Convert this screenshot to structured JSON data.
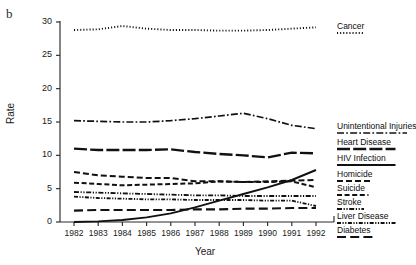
{
  "panel": {
    "label": "b"
  },
  "chart_data": {
    "type": "line",
    "title": "",
    "xlabel": "Year",
    "ylabel": "Rate",
    "xlim": [
      1981.4,
      1992.6
    ],
    "ylim": [
      0,
      30
    ],
    "grid": false,
    "legend_position": "right",
    "x": [
      1982,
      1983,
      1984,
      1985,
      1986,
      1987,
      1988,
      1989,
      1990,
      1991,
      1992
    ],
    "xticks": [
      "1982",
      "1983",
      "1984",
      "1985",
      "1986",
      "1987",
      "1988",
      "1989",
      "1990",
      "1991",
      "1992"
    ],
    "yticks": [
      "0",
      "5",
      "10",
      "15",
      "20",
      "25",
      "30"
    ],
    "series": [
      {
        "name": "Cancer",
        "style": "dotted",
        "values": [
          28.8,
          28.9,
          29.4,
          29.0,
          28.8,
          28.8,
          28.7,
          28.7,
          28.8,
          29.0,
          29.2
        ]
      },
      {
        "name": "Unintentional Injuries",
        "style": "dash-dot",
        "values": [
          15.2,
          15.1,
          15.0,
          15.0,
          15.2,
          15.5,
          15.9,
          16.3,
          15.5,
          14.5,
          14.0
        ]
      },
      {
        "name": "Heart Disease",
        "style": "long-dash",
        "values": [
          11.0,
          10.8,
          10.8,
          10.8,
          10.9,
          10.5,
          10.2,
          10.0,
          9.7,
          10.4,
          10.3
        ]
      },
      {
        "name": "HIV Infection",
        "style": "solid",
        "values": [
          0.0,
          0.1,
          0.3,
          0.7,
          1.3,
          2.2,
          3.2,
          4.2,
          5.2,
          6.3,
          7.8
        ]
      },
      {
        "name": "Homicide",
        "style": "dash",
        "values": [
          7.5,
          7.0,
          6.8,
          6.6,
          6.6,
          6.1,
          6.1,
          6.0,
          6.1,
          6.2,
          6.3
        ]
      },
      {
        "name": "Suicide",
        "style": "medium-dash",
        "values": [
          5.9,
          5.7,
          5.5,
          5.6,
          5.7,
          5.8,
          6.1,
          6.0,
          6.0,
          6.1,
          5.2
        ]
      },
      {
        "name": "Stroke",
        "style": "dash-dot-dot",
        "values": [
          4.5,
          4.4,
          4.3,
          4.2,
          4.1,
          4.0,
          4.0,
          3.9,
          3.9,
          3.9,
          3.9
        ]
      },
      {
        "name": "Liver Disease",
        "style": "dot-dash",
        "values": [
          3.8,
          3.6,
          3.5,
          3.4,
          3.4,
          3.3,
          3.3,
          3.3,
          3.2,
          3.2,
          2.4
        ]
      },
      {
        "name": "Diabetes",
        "style": "wide-dash",
        "values": [
          1.7,
          1.8,
          1.8,
          1.8,
          1.8,
          1.9,
          1.9,
          2.0,
          2.0,
          2.1,
          2.1
        ]
      }
    ],
    "legend_entries": [
      {
        "label": "Cancer",
        "style": "dotted"
      },
      {
        "label": "Unintentional Injuries",
        "style": "dash-dot"
      },
      {
        "label": "Heart Disease",
        "style": "long-dash"
      },
      {
        "label": "HIV Infection",
        "style": "solid"
      },
      {
        "label": "Homicide",
        "style": "dash"
      },
      {
        "label": "Suicide",
        "style": "medium-dash"
      },
      {
        "label": "Stroke",
        "style": "dash-dot-dot"
      },
      {
        "label": "Liver Disease",
        "style": "dot-dash"
      },
      {
        "label": "Diabetes",
        "style": "wide-dash"
      }
    ]
  }
}
